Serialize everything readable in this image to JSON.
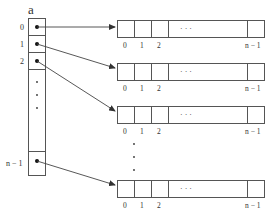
{
  "diagram": {
    "array_name": "a",
    "left_array": {
      "index_labels": [
        "0",
        "1",
        "2",
        "n − 1"
      ],
      "ellipsis": "vertical-dots"
    },
    "rows": [
      {
        "index_labels": [
          "0",
          "1",
          "2",
          "n − 1"
        ],
        "ellipsis": "· · ·"
      },
      {
        "index_labels": [
          "0",
          "1",
          "2",
          "n − 1"
        ],
        "ellipsis": "· · ·"
      },
      {
        "index_labels": [
          "0",
          "1",
          "2",
          "n − 1"
        ],
        "ellipsis": "· · ·"
      },
      {
        "index_labels": [
          "0",
          "1",
          "2",
          "n − 1"
        ],
        "ellipsis": "· · ·"
      }
    ],
    "between_rows_ellipsis": "vertical-dots",
    "colors": {
      "line": "#444444",
      "text": "#333333",
      "background": "#ffffff"
    }
  }
}
